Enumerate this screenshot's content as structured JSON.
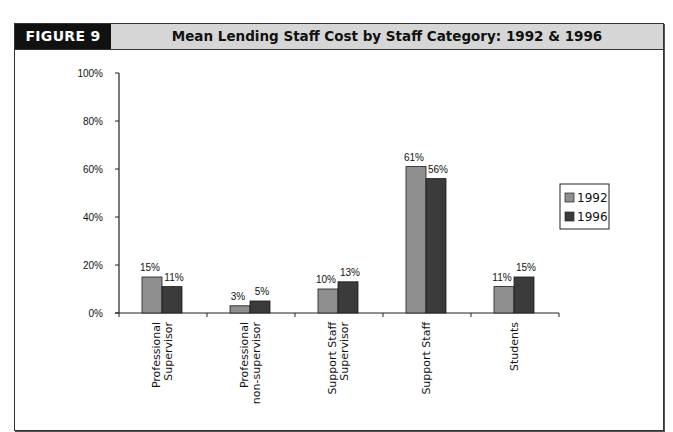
{
  "figure": {
    "tag": "FIGURE 9",
    "title": "Mean Lending Staff Cost by Staff Category: 1992 & 1996"
  },
  "colors": {
    "series_1992": "#8f8f8f",
    "series_1996": "#3b3b3b",
    "header_bg": "#d6d6d6",
    "tag_bg": "#111111"
  },
  "chart_data": {
    "type": "bar",
    "title": "Mean Lending Staff Cost by Staff Category: 1992 & 1996",
    "xlabel": "",
    "ylabel": "",
    "ylim": [
      0,
      100
    ],
    "yticks": [
      "0%",
      "20%",
      "40%",
      "60%",
      "80%",
      "100%"
    ],
    "categories": [
      "Professional Supervisor",
      "Professional non-supervisor",
      "Support Staff Supervisor",
      "Support Staff",
      "Students"
    ],
    "series": [
      {
        "name": "1992",
        "values": [
          15,
          3,
          10,
          61,
          11
        ]
      },
      {
        "name": "1996",
        "values": [
          11,
          5,
          13,
          56,
          15
        ]
      }
    ],
    "data_labels": {
      "1992": [
        "15%",
        "3%",
        "10%",
        "61%",
        "11%"
      ],
      "1996": [
        "11%",
        "5%",
        "13%",
        "56%",
        "15%"
      ]
    },
    "legend": {
      "position": "right",
      "entries": [
        "1992",
        "1996"
      ]
    },
    "grid": false
  }
}
